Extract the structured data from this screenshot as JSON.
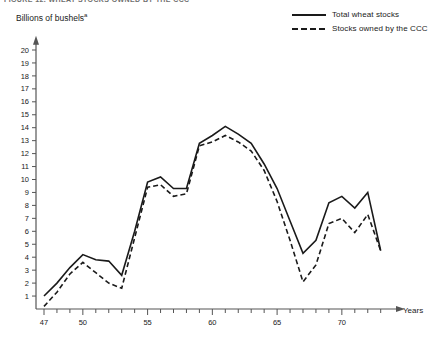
{
  "figure": {
    "title": "FIGURE 12. WHEAT STOCKS OWNED BY THE CCC",
    "y_axis_title": "Billions of bushels",
    "y_axis_footnote": "a",
    "x_axis_title": "Years"
  },
  "legend": {
    "position": "top-right",
    "items": [
      {
        "label": "Total wheat stocks",
        "style": "solid",
        "color": "#1a1a1a"
      },
      {
        "label": "Stocks owned by the CCC",
        "style": "dashed",
        "color": "#1a1a1a"
      }
    ]
  },
  "axes": {
    "y_ticks": [
      "20",
      "19",
      "18",
      "17",
      "16",
      "15",
      "14",
      "13",
      "12",
      "11",
      "10",
      "9",
      "8",
      "7",
      "6",
      "5",
      "4",
      "3",
      "2",
      "1"
    ],
    "x_labeled_ticks": [
      "47",
      "50",
      "55",
      "60",
      "65",
      "70"
    ],
    "x_min": 47,
    "x_max": 73,
    "y_min": 0,
    "y_max": 20.8,
    "grid": false
  },
  "chart_data": {
    "type": "line",
    "title": "FIGURE 12. WHEAT STOCKS OWNED BY THE CCC",
    "xlabel": "Years",
    "ylabel": "Billions of bushels",
    "xlim": [
      47,
      73
    ],
    "ylim": [
      0,
      20.8
    ],
    "grid": false,
    "legend_position": "top-right",
    "x": [
      47,
      48,
      49,
      50,
      51,
      52,
      53,
      54,
      55,
      56,
      57,
      58,
      59,
      60,
      61,
      62,
      63,
      64,
      65,
      66,
      67,
      68,
      69,
      70,
      71,
      72,
      73
    ],
    "series": [
      {
        "name": "Total wheat stocks",
        "style": "solid",
        "color": "#1a1a1a",
        "values": [
          1.0,
          2.0,
          3.2,
          4.2,
          3.8,
          3.7,
          2.6,
          6.0,
          9.8,
          10.2,
          9.3,
          9.3,
          12.8,
          13.4,
          14.1,
          13.5,
          12.8,
          11.2,
          9.3,
          6.8,
          4.3,
          5.3,
          8.2,
          8.7,
          7.8,
          9.0,
          4.5
        ]
      },
      {
        "name": "Stocks owned by the CCC",
        "style": "dashed",
        "color": "#1a1a1a",
        "values": [
          0.2,
          1.3,
          2.7,
          3.6,
          2.8,
          2.0,
          1.6,
          5.5,
          9.4,
          9.6,
          8.7,
          8.9,
          12.6,
          12.9,
          13.4,
          12.9,
          12.2,
          10.7,
          8.3,
          5.3,
          2.1,
          3.4,
          6.6,
          7.0,
          5.9,
          7.3,
          4.5
        ]
      }
    ]
  }
}
